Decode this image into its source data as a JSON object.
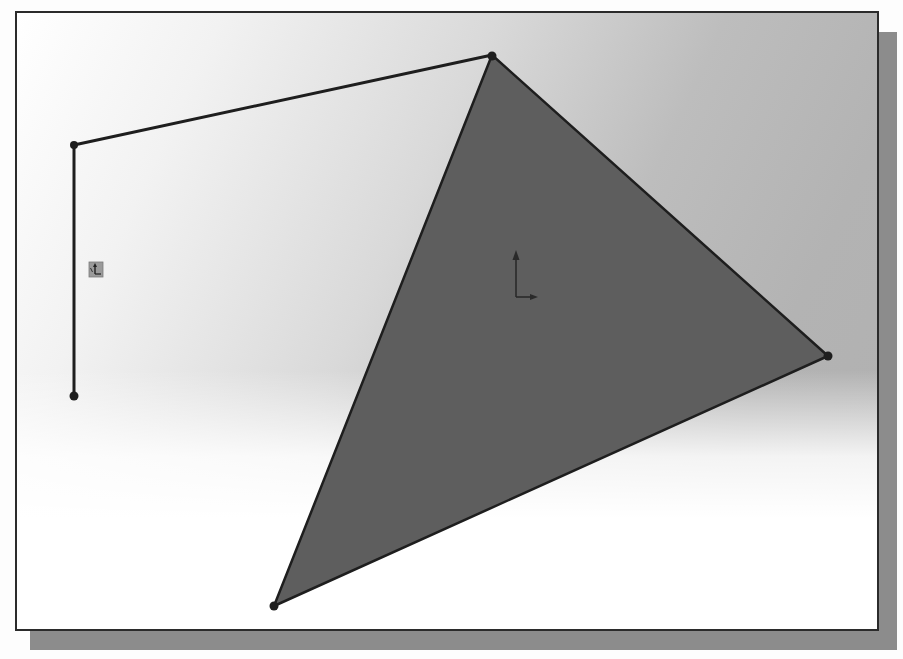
{
  "window": {
    "title": "SOLIDWORKS 2D Sketch Viewport"
  },
  "viewport": {
    "background_top": "#ffffff",
    "background_mid": "#c8c8c8",
    "frame_color": "#2b2b2b",
    "shadow_color": "#8c8c8c"
  },
  "sketch": {
    "line_color": "#1e1e1e",
    "fill_color": "#5e5e5e",
    "open_polyline": {
      "name": "open sketch polyline",
      "points": [
        [
          74,
          396
        ],
        [
          74,
          145
        ],
        [
          492,
          55
        ]
      ]
    },
    "triangle": {
      "name": "closed triangle region",
      "points": [
        [
          492,
          55
        ],
        [
          828,
          356
        ],
        [
          274,
          606
        ]
      ]
    },
    "vertices": [
      {
        "id": "v1",
        "x": 74,
        "y": 145
      },
      {
        "id": "v2",
        "x": 74,
        "y": 396
      },
      {
        "id": "v3",
        "x": 492,
        "y": 55
      },
      {
        "id": "v4",
        "x": 828,
        "y": 356
      },
      {
        "id": "v5",
        "x": 274,
        "y": 606
      }
    ]
  },
  "origin_marker": {
    "label": "sketch origin",
    "x": 516,
    "y": 297
  },
  "coordinate_icon": {
    "label": "reference triad",
    "x": 89,
    "y": 262
  }
}
